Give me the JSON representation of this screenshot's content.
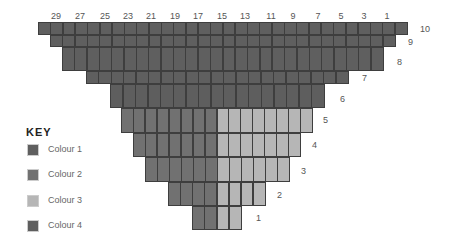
{
  "colors": {
    "colour1": "#5f5f5f",
    "colour2": "#717171",
    "colour3": "#b6b6b6",
    "colour4": "#5e5e5e",
    "grid_line": "#3e3e3e",
    "label_text": "#555555"
  },
  "grid": {
    "cell_width": 12.3,
    "column_labels": [
      {
        "text": "29",
        "x": 56
      },
      {
        "text": "27",
        "x": 80
      },
      {
        "text": "25",
        "x": 105
      },
      {
        "text": "23",
        "x": 128
      },
      {
        "text": "21",
        "x": 151
      },
      {
        "text": "19",
        "x": 175
      },
      {
        "text": "17",
        "x": 198
      },
      {
        "text": "15",
        "x": 222
      },
      {
        "text": "13",
        "x": 245
      },
      {
        "text": "11",
        "x": 271
      },
      {
        "text": "9",
        "x": 293
      },
      {
        "text": "7",
        "x": 318
      },
      {
        "text": "5",
        "x": 341
      },
      {
        "text": "3",
        "x": 364
      },
      {
        "text": "1",
        "x": 387
      }
    ],
    "rows": [
      {
        "label": "10",
        "top": 22,
        "height": 13,
        "left": 38,
        "right": 407,
        "split": null,
        "color_left": "colour1",
        "color_right": "colour1",
        "label_x": 420,
        "label_y": 24
      },
      {
        "label": "9",
        "top": 35,
        "height": 12,
        "left": 50,
        "right": 395,
        "split": null,
        "color_left": "colour1",
        "color_right": "colour1",
        "label_x": 408,
        "label_y": 37
      },
      {
        "label": "8",
        "top": 47,
        "height": 24,
        "left": 62,
        "right": 383,
        "split": null,
        "color_left": "colour1",
        "color_right": "colour1",
        "label_x": 397,
        "label_y": 57
      },
      {
        "label": "7",
        "top": 71,
        "height": 13,
        "left": 86,
        "right": 348,
        "split": null,
        "color_left": "colour1",
        "color_right": "colour1",
        "label_x": 362,
        "label_y": 73
      },
      {
        "label": "6",
        "top": 84,
        "height": 24,
        "left": 110,
        "right": 324,
        "split": null,
        "color_left": "colour4",
        "color_right": "colour4",
        "label_x": 340,
        "label_y": 94
      },
      {
        "label": "5",
        "top": 108,
        "height": 25,
        "left": 121,
        "right": 312,
        "split": 216,
        "color_left": "colour2",
        "color_right": "colour3",
        "label_x": 323,
        "label_y": 115
      },
      {
        "label": "4",
        "top": 133,
        "height": 24,
        "left": 133,
        "right": 300,
        "split": 216,
        "color_left": "colour2",
        "color_right": "colour3",
        "label_x": 312,
        "label_y": 140
      },
      {
        "label": "3",
        "top": 157,
        "height": 25,
        "left": 145,
        "right": 289,
        "split": 216,
        "color_left": "colour2",
        "color_right": "colour3",
        "label_x": 301,
        "label_y": 166
      },
      {
        "label": "2",
        "top": 182,
        "height": 24,
        "left": 168,
        "right": 265,
        "split": 216,
        "color_left": "colour2",
        "color_right": "colour3",
        "label_x": 277,
        "label_y": 190
      },
      {
        "label": "1",
        "top": 206,
        "height": 24,
        "left": 192,
        "right": 241,
        "split": 216,
        "color_left": "colour2",
        "color_right": "colour3",
        "label_x": 256,
        "label_y": 213
      }
    ]
  },
  "key": {
    "title": "KEY",
    "items": [
      {
        "label": "Colour 1",
        "color": "colour1",
        "top": 144
      },
      {
        "label": "Colour 2",
        "color": "colour2",
        "top": 169
      },
      {
        "label": "Colour 3",
        "color": "colour3",
        "top": 195
      },
      {
        "label": "Colour 4",
        "color": "colour4",
        "top": 220
      }
    ]
  }
}
